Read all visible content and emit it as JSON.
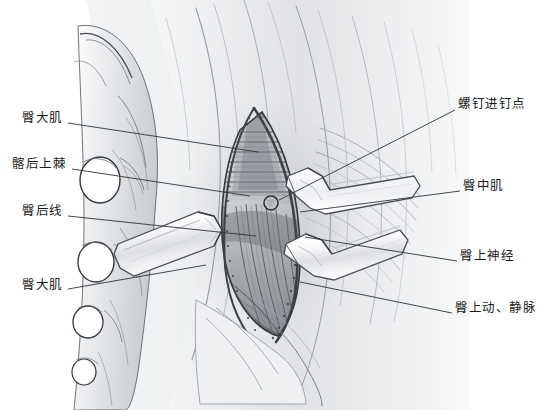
{
  "figure": {
    "style": "pencil-shaded medical illustration",
    "width": 537,
    "height": 410,
    "background_color": "#ffffff",
    "line_color": "#3a3a3a",
    "tone_color": "#b9bcc0"
  },
  "labels": {
    "left": [
      {
        "id": "gluteus-maximus-upper",
        "text": "臀大肌",
        "text_x": 22,
        "text_y": 118,
        "leader": {
          "x1": 68,
          "y1": 123,
          "x2": 258,
          "y2": 152
        }
      },
      {
        "id": "posterior-superior-iliac-spine",
        "text": "髂后上棘",
        "text_x": 12,
        "text_y": 164,
        "leader": {
          "x1": 72,
          "y1": 169,
          "x2": 250,
          "y2": 196
        }
      },
      {
        "id": "posterior-gluteal-line",
        "text": "臀后线",
        "text_x": 22,
        "text_y": 211,
        "leader": {
          "x1": 68,
          "y1": 216,
          "x2": 256,
          "y2": 236
        }
      },
      {
        "id": "gluteus-maximus-lower",
        "text": "臀大肌",
        "text_x": 22,
        "text_y": 285,
        "leader": {
          "x1": 68,
          "y1": 289,
          "x2": 206,
          "y2": 265
        }
      }
    ],
    "right": [
      {
        "id": "screw-entry-point",
        "text": "螺钉进钉点",
        "text_x": 458,
        "text_y": 104,
        "leader": {
          "x1": 455,
          "y1": 110,
          "x2": 279,
          "y2": 200
        }
      },
      {
        "id": "gluteus-medius",
        "text": "臀中肌",
        "text_x": 463,
        "text_y": 186,
        "leader": {
          "x1": 460,
          "y1": 191,
          "x2": 300,
          "y2": 212
        }
      },
      {
        "id": "superior-gluteal-nerve",
        "text": "臀上神经",
        "text_x": 460,
        "text_y": 256,
        "leader": {
          "x1": 457,
          "y1": 261,
          "x2": 305,
          "y2": 237
        }
      },
      {
        "id": "superior-gluteal-artery-vein",
        "text": "臀上动、静脉",
        "text_x": 455,
        "text_y": 308,
        "leader": {
          "x1": 452,
          "y1": 313,
          "x2": 300,
          "y2": 282
        }
      }
    ]
  },
  "anatomy": {
    "sacral_foramina": [
      {
        "cx": 100,
        "cy": 180,
        "rx": 20,
        "ry": 23
      },
      {
        "cx": 96,
        "cy": 262,
        "rx": 18,
        "ry": 20
      },
      {
        "cx": 88,
        "cy": 322,
        "rx": 15,
        "ry": 16
      },
      {
        "cx": 84,
        "cy": 372,
        "rx": 12,
        "ry": 13
      }
    ],
    "screw_entry_marker": {
      "cx": 271,
      "cy": 203,
      "r": 7
    },
    "retractors": [
      {
        "id": "retractor-left",
        "note": "left retractor blade"
      },
      {
        "id": "retractor-upper-right",
        "note": "upper right retractor blade"
      },
      {
        "id": "retractor-lower-right",
        "note": "lower right retractor blade"
      }
    ],
    "incision": {
      "note": "vertical fusiform surgical incision with everted skin edges"
    }
  }
}
